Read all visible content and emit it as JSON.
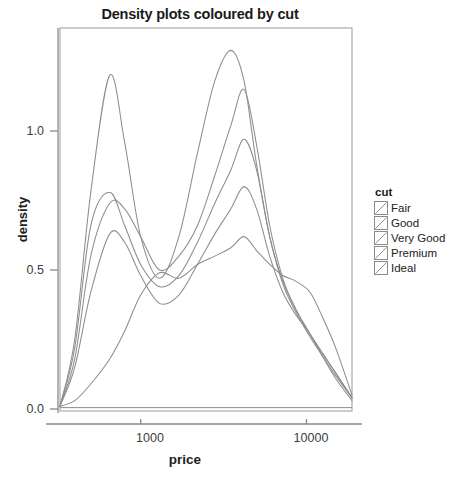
{
  "chart_data": {
    "type": "line",
    "title": "Density plots coloured by cut",
    "xlabel": "price",
    "ylabel": "density",
    "xscale": "log",
    "xticks": [
      1000,
      10000
    ],
    "xtick_labels": [
      "1000",
      "10000"
    ],
    "yticks": [
      0.0,
      0.5,
      1.0
    ],
    "ytick_labels": [
      "0.0",
      "0.5",
      "1.0"
    ],
    "xlim": [
      326,
      18823
    ],
    "ylim": [
      0.0,
      1.35
    ],
    "grid": false,
    "legend_title": "cut",
    "legend_position": "right",
    "series": [
      {
        "name": "Fair",
        "color": "#8d8d8d",
        "x": [
          326,
          400,
          500,
          650,
          800,
          1000,
          1300,
          1700,
          2200,
          2800,
          3500,
          4200,
          5000,
          6000,
          7200,
          8600,
          10500,
          12500,
          15000,
          18823
        ],
        "y": [
          0.01,
          0.03,
          0.09,
          0.18,
          0.28,
          0.41,
          0.49,
          0.47,
          0.52,
          0.55,
          0.58,
          0.62,
          0.57,
          0.52,
          0.48,
          0.46,
          0.42,
          0.33,
          0.22,
          0.05
        ]
      },
      {
        "name": "Good",
        "color": "#8d8d8d",
        "x": [
          326,
          400,
          500,
          650,
          800,
          1000,
          1300,
          1700,
          2200,
          2800,
          3500,
          4200,
          5000,
          6000,
          7200,
          8600,
          10500,
          12500,
          15000,
          18823
        ],
        "y": [
          0.01,
          0.15,
          0.42,
          0.63,
          0.6,
          0.48,
          0.38,
          0.41,
          0.52,
          0.63,
          0.72,
          0.8,
          0.72,
          0.55,
          0.42,
          0.34,
          0.27,
          0.2,
          0.13,
          0.04
        ]
      },
      {
        "name": "Very Good",
        "color": "#8d8d8d",
        "x": [
          326,
          400,
          500,
          650,
          800,
          1000,
          1300,
          1700,
          2200,
          2800,
          3500,
          4200,
          5000,
          6000,
          7200,
          8600,
          10500,
          12500,
          15000,
          18823
        ],
        "y": [
          0.01,
          0.22,
          0.66,
          0.78,
          0.66,
          0.52,
          0.44,
          0.48,
          0.6,
          0.74,
          0.86,
          0.97,
          0.86,
          0.62,
          0.45,
          0.35,
          0.26,
          0.19,
          0.12,
          0.04
        ]
      },
      {
        "name": "Premium",
        "color": "#8d8d8d",
        "x": [
          326,
          400,
          500,
          650,
          800,
          1000,
          1300,
          1700,
          2200,
          2800,
          3500,
          4200,
          5000,
          6000,
          7200,
          8600,
          10500,
          12500,
          15000,
          18823
        ],
        "y": [
          0.01,
          0.18,
          0.55,
          0.74,
          0.72,
          0.62,
          0.5,
          0.55,
          0.66,
          0.84,
          1.02,
          1.15,
          0.95,
          0.66,
          0.47,
          0.36,
          0.27,
          0.2,
          0.13,
          0.04
        ]
      },
      {
        "name": "Ideal",
        "color": "#8d8d8d",
        "x": [
          326,
          400,
          500,
          650,
          800,
          1000,
          1300,
          1700,
          2200,
          2800,
          3500,
          4200,
          5000,
          6000,
          7200,
          8600,
          10500,
          12500,
          15000,
          18823
        ],
        "y": [
          0.01,
          0.25,
          0.78,
          1.2,
          0.96,
          0.62,
          0.47,
          0.62,
          0.92,
          1.18,
          1.29,
          1.18,
          0.88,
          0.62,
          0.46,
          0.36,
          0.27,
          0.19,
          0.11,
          0.03
        ]
      }
    ]
  },
  "legend": {
    "title": "cut",
    "items": [
      {
        "label": "Fair"
      },
      {
        "label": "Good"
      },
      {
        "label": "Very Good"
      },
      {
        "label": "Premium"
      },
      {
        "label": "Ideal"
      }
    ]
  },
  "axes": {
    "y_title": "density",
    "x_title": "price",
    "y_tick_labels": [
      "1.0",
      "0.5",
      "0.0"
    ],
    "x_tick_labels": [
      "1000",
      "10000"
    ]
  },
  "colors": {
    "curve": "#8d8d8d",
    "axis": "#8a8a8a",
    "text": "#1a1a1a",
    "tick_text": "#3c3c3c",
    "panel_border": "#9a9a9a"
  }
}
